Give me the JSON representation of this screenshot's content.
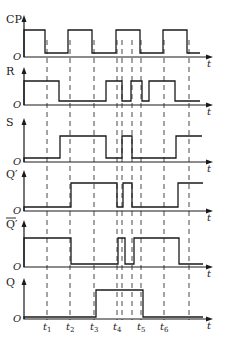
{
  "diagram": {
    "title": "",
    "origin_label": "O",
    "time_axis_label": "t",
    "signals": [
      {
        "id": "CP",
        "label": "CP",
        "overline": false
      },
      {
        "id": "R",
        "label": "R",
        "overline": false
      },
      {
        "id": "S",
        "label": "S",
        "overline": false
      },
      {
        "id": "Qp",
        "label": "Q′",
        "overline": false
      },
      {
        "id": "Qpbar",
        "label": "Q′",
        "overline": true
      },
      {
        "id": "Q",
        "label": "Q",
        "overline": false
      }
    ],
    "time_markers": [
      {
        "label": "t",
        "sub": "1"
      },
      {
        "label": "t",
        "sub": "2"
      },
      {
        "label": "t",
        "sub": "3"
      },
      {
        "label": "t",
        "sub": "4"
      },
      {
        "label": "t",
        "sub": "5"
      },
      {
        "label": "t",
        "sub": "6"
      }
    ]
  },
  "chart_data": {
    "type": "timing",
    "x_axis": "t",
    "x_range": [
      24,
      213
    ],
    "time_marker_positions": {
      "t1": 47,
      "t2": 70,
      "t3": 94,
      "t4": 117,
      "t5": 141,
      "t6": 164,
      "end": 189
    },
    "extra_dashed_positions": [
      122,
      132
    ],
    "waveforms": {
      "CP": {
        "transitions_x": [
          24,
          45,
          68,
          92,
          116,
          140,
          163,
          187,
          200
        ],
        "levels": [
          1,
          0,
          1,
          0,
          1,
          0,
          1,
          0
        ]
      },
      "R": {
        "transitions_x": [
          24,
          59,
          106,
          122,
          131,
          142,
          149,
          175,
          200
        ],
        "levels": [
          1,
          0,
          1,
          0,
          1,
          0,
          1,
          0
        ]
      },
      "S": {
        "transitions_x": [
          24,
          60,
          106,
          122,
          132,
          176,
          202
        ],
        "levels": [
          0,
          1,
          0,
          1,
          0,
          1
        ]
      },
      "Qp": {
        "transitions_x": [
          24,
          71,
          117,
          123,
          132,
          178,
          203
        ],
        "levels": [
          0,
          1,
          0,
          1,
          0,
          1
        ]
      },
      "Qpbar": {
        "transitions_x": [
          24,
          71,
          118,
          125,
          134,
          179,
          203
        ],
        "levels": [
          1,
          0,
          1,
          0,
          1,
          0
        ]
      },
      "Q": {
        "transitions_x": [
          24,
          96,
          143,
          203
        ],
        "levels": [
          0,
          1,
          0
        ]
      }
    }
  }
}
